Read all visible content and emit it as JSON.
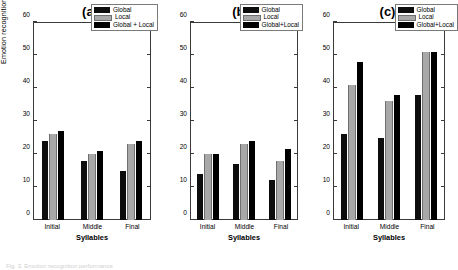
{
  "figure": {
    "caption": "Fig. 3. Emotion recognition performance"
  },
  "chart_data": [
    {
      "type": "bar",
      "title": "(a)",
      "xlabel": "Syllables",
      "ylabel": "Emotion recognition performance (%)",
      "categories": [
        "Initial",
        "Middle",
        "Final"
      ],
      "yticks": [
        0,
        10,
        20,
        30,
        40,
        50,
        60
      ],
      "ylim": [
        0,
        60
      ],
      "grid": false,
      "legend_position": "top-right",
      "series": [
        {
          "name": "Global",
          "color": "#0d0d0d",
          "values": [
            24,
            18,
            15
          ]
        },
        {
          "name": "Local",
          "color": "#a8a8a8",
          "values": [
            26,
            20,
            23
          ]
        },
        {
          "name": "Global + Local",
          "color": "#000000",
          "values": [
            27,
            21,
            24
          ]
        }
      ]
    },
    {
      "type": "bar",
      "title": "(b)",
      "xlabel": "Syllables",
      "ylabel": "",
      "categories": [
        "Initial",
        "Middle",
        "Final"
      ],
      "yticks": [
        0,
        10,
        20,
        30,
        40,
        50,
        60
      ],
      "ylim": [
        0,
        60
      ],
      "grid": false,
      "legend_position": "top-right",
      "series": [
        {
          "name": "Global",
          "color": "#0d0d0d",
          "values": [
            14,
            17,
            12
          ]
        },
        {
          "name": "Local",
          "color": "#a8a8a8",
          "values": [
            20,
            23,
            18
          ]
        },
        {
          "name": "Global+Local",
          "color": "#000000",
          "values": [
            20,
            24,
            21.5
          ]
        }
      ]
    },
    {
      "type": "bar",
      "title": "(c)",
      "xlabel": "Syllables",
      "ylabel": "",
      "categories": [
        "Initial",
        "Middle",
        "Final"
      ],
      "yticks": [
        0,
        10,
        20,
        30,
        40,
        50,
        60
      ],
      "ylim": [
        0,
        60
      ],
      "grid": false,
      "legend_position": "top-right",
      "series": [
        {
          "name": "Global",
          "color": "#0d0d0d",
          "values": [
            26,
            25,
            38
          ]
        },
        {
          "name": "Local",
          "color": "#a8a8a8",
          "values": [
            41,
            36,
            51
          ]
        },
        {
          "name": "Global+Local",
          "color": "#000000",
          "values": [
            48,
            38,
            51
          ]
        }
      ]
    }
  ]
}
